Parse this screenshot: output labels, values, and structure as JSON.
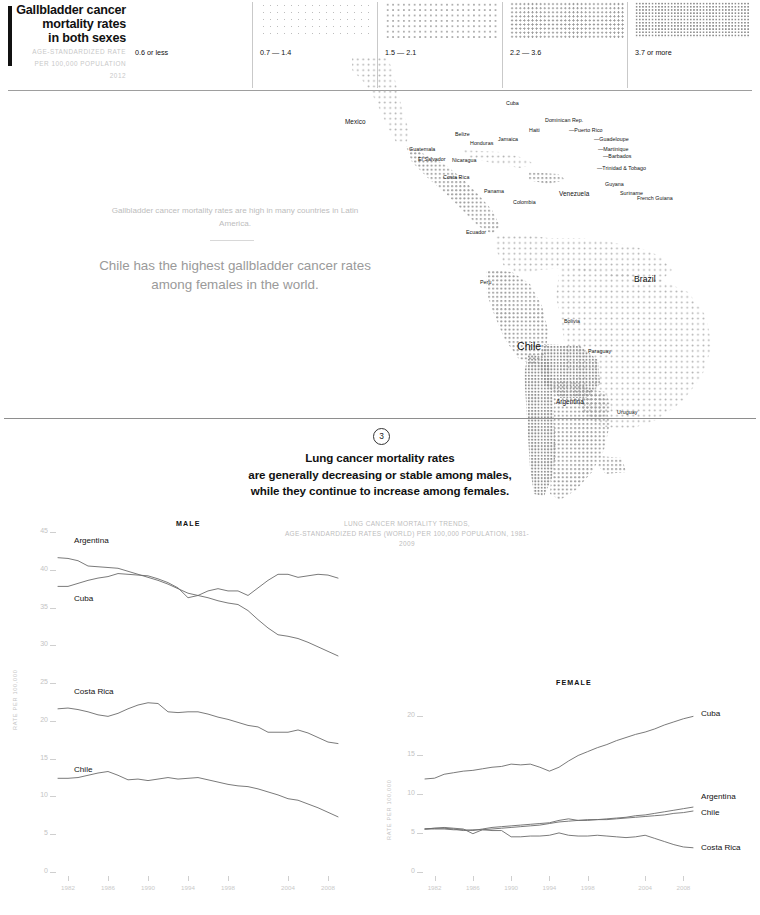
{
  "header": {
    "title_lines": [
      "Gallbladder cancer",
      "mortality rates",
      "in both sexes"
    ],
    "subtitle_lines": [
      "AGE-STANDARDIZED RATE",
      "PER 100,000 POPULATION",
      "2012"
    ]
  },
  "legend": {
    "items": [
      {
        "label": "0.6 or less",
        "density": "d1"
      },
      {
        "label": "0.7 — 1.4",
        "density": "d2"
      },
      {
        "label": "1.5 — 2.1",
        "density": "d3"
      },
      {
        "label": "2.2 — 3.6",
        "density": "d4"
      },
      {
        "label": "3.7 or more",
        "density": "d5"
      }
    ]
  },
  "map": {
    "labels": [
      {
        "name": "Mexico",
        "x": 345,
        "y": 118,
        "size": "md"
      },
      {
        "name": "Guatemala",
        "x": 409,
        "y": 146,
        "size": "sm"
      },
      {
        "name": "Belize",
        "x": 455,
        "y": 131,
        "size": "sm"
      },
      {
        "name": "Honduras",
        "x": 470,
        "y": 140,
        "size": "sm"
      },
      {
        "name": "El Salvador",
        "x": 418,
        "y": 156,
        "size": "sm"
      },
      {
        "name": "Nicaragua",
        "x": 452,
        "y": 157,
        "size": "sm"
      },
      {
        "name": "Costa Rica",
        "x": 443,
        "y": 174,
        "size": "sm"
      },
      {
        "name": "Panama",
        "x": 484,
        "y": 188,
        "size": "sm"
      },
      {
        "name": "Cuba",
        "x": 506,
        "y": 100,
        "size": "sm"
      },
      {
        "name": "Jamaica",
        "x": 498,
        "y": 136,
        "size": "sm"
      },
      {
        "name": "Haiti",
        "x": 529,
        "y": 127,
        "size": "sm"
      },
      {
        "name": "Dominican Rep.",
        "x": 545,
        "y": 117,
        "size": "sm"
      },
      {
        "name": "—Puerto Rico",
        "x": 569,
        "y": 127,
        "size": "sm"
      },
      {
        "name": "—Guadeloupe",
        "x": 594,
        "y": 136,
        "size": "sm"
      },
      {
        "name": "—Martinique",
        "x": 598,
        "y": 146,
        "size": "sm"
      },
      {
        "name": "—Barbados",
        "x": 603,
        "y": 153,
        "size": "sm"
      },
      {
        "name": "—Trinidad & Tobago",
        "x": 597,
        "y": 165,
        "size": "sm"
      },
      {
        "name": "Colombia",
        "x": 513,
        "y": 199,
        "size": "sm"
      },
      {
        "name": "Venezuela",
        "x": 559,
        "y": 190,
        "size": "md"
      },
      {
        "name": "Guyana",
        "x": 605,
        "y": 181,
        "size": "sm"
      },
      {
        "name": "Suriname",
        "x": 620,
        "y": 190,
        "size": "sm"
      },
      {
        "name": "French Guiana",
        "x": 637,
        "y": 195,
        "size": "sm"
      },
      {
        "name": "Ecuador",
        "x": 466,
        "y": 229,
        "size": "sm"
      },
      {
        "name": "Peru",
        "x": 480,
        "y": 279,
        "size": "sm"
      },
      {
        "name": "Brazil",
        "x": 634,
        "y": 274,
        "size": "lg"
      },
      {
        "name": "Bolivia",
        "x": 564,
        "y": 318,
        "size": "sm"
      },
      {
        "name": "Chile",
        "x": 517,
        "y": 340,
        "size": "xl"
      },
      {
        "name": "Paraguay",
        "x": 588,
        "y": 348,
        "size": "sm"
      },
      {
        "name": "Argentina",
        "x": 556,
        "y": 398,
        "size": "md"
      },
      {
        "name": "Uruguay",
        "x": 617,
        "y": 409,
        "size": "sm"
      }
    ]
  },
  "annotations": {
    "small": "Gallbladder cancer mortality rates are high in many countries in Latin America.",
    "large": "Chile has the highest gallbladder cancer rates among females in the world."
  },
  "section3": {
    "number": "3",
    "heading_lines": [
      "Lung cancer mortality rates",
      "are generally decreasing or stable among males,",
      "while they continue to increase among females."
    ],
    "chart_subtitle_lines": [
      "LUNG CANCER MORTALITY TRENDS,",
      "AGE-STANDARDIZED RATES (WORLD) PER 100,000 POPULATION, 1981-2009"
    ]
  },
  "chart_data": [
    {
      "type": "line",
      "panel": "MALE",
      "title": "LUNG CANCER MORTALITY TRENDS,",
      "subtitle": "AGE-STANDARDIZED RATES (WORLD) PER 100,000 POPULATION, 1981-2009",
      "xlabel": "",
      "ylabel": "RATE PER 100,000",
      "xlim": [
        1981,
        2009
      ],
      "ylim": [
        0,
        45
      ],
      "yticks": [
        0,
        5,
        10,
        15,
        20,
        25,
        30,
        35,
        40,
        45
      ],
      "xticks": [
        1982,
        1986,
        1990,
        1994,
        1998,
        2004,
        2008
      ],
      "grid": false,
      "legend_position": "inline-left",
      "x": [
        1981,
        1982,
        1983,
        1984,
        1985,
        1986,
        1987,
        1988,
        1989,
        1990,
        1991,
        1992,
        1993,
        1994,
        1995,
        1996,
        1997,
        1998,
        1999,
        2000,
        2001,
        2002,
        2003,
        2004,
        2005,
        2006,
        2007,
        2008,
        2009
      ],
      "series": [
        {
          "name": "Argentina",
          "label_side": "left",
          "values": [
            41.6,
            41.5,
            41.2,
            40.5,
            40.4,
            40.3,
            40.2,
            39.8,
            39.4,
            39.0,
            38.6,
            38.1,
            37.5,
            36.9,
            36.6,
            36.3,
            35.9,
            35.6,
            35.4,
            34.6,
            33.4,
            32.3,
            31.4,
            31.2,
            30.9,
            30.4,
            29.8,
            29.2,
            28.6
          ]
        },
        {
          "name": "Cuba",
          "label_side": "left",
          "values": [
            37.8,
            37.8,
            38.2,
            38.6,
            38.9,
            39.1,
            39.5,
            39.4,
            39.3,
            39.2,
            38.8,
            38.3,
            37.6,
            36.3,
            36.6,
            37.2,
            37.5,
            37.2,
            37.2,
            36.6,
            37.6,
            38.6,
            39.4,
            39.4,
            39.0,
            39.2,
            39.4,
            39.3,
            38.9
          ]
        },
        {
          "name": "Costa Rica",
          "label_side": "left",
          "values": [
            21.6,
            21.7,
            21.5,
            21.2,
            20.8,
            20.6,
            21.0,
            21.6,
            22.1,
            22.4,
            22.3,
            21.2,
            21.1,
            21.2,
            21.2,
            20.9,
            20.5,
            20.2,
            19.8,
            19.4,
            19.2,
            18.5,
            18.5,
            18.5,
            18.8,
            18.4,
            17.8,
            17.2,
            17.0
          ]
        },
        {
          "name": "Chile",
          "label_side": "left",
          "values": [
            12.4,
            12.4,
            12.5,
            12.8,
            13.1,
            13.3,
            12.8,
            12.2,
            12.3,
            12.1,
            12.3,
            12.5,
            12.3,
            12.4,
            12.5,
            12.2,
            11.9,
            11.6,
            11.4,
            11.3,
            11.0,
            10.6,
            10.2,
            9.7,
            9.5,
            9.0,
            8.5,
            7.9,
            7.3
          ]
        }
      ]
    },
    {
      "type": "line",
      "panel": "FEMALE",
      "xlabel": "",
      "ylabel": "RATE PER 100,000",
      "xlim": [
        1981,
        2009
      ],
      "ylim": [
        0,
        22
      ],
      "yticks": [
        0,
        5,
        10,
        15,
        20
      ],
      "xticks": [
        1982,
        1986,
        1990,
        1994,
        1998,
        2004,
        2008
      ],
      "grid": false,
      "legend_position": "right",
      "x": [
        1981,
        1982,
        1983,
        1984,
        1985,
        1986,
        1987,
        1988,
        1989,
        1990,
        1991,
        1992,
        1993,
        1994,
        1995,
        1996,
        1997,
        1998,
        1999,
        2000,
        2001,
        2002,
        2003,
        2004,
        2005,
        2006,
        2007,
        2008,
        2009
      ],
      "series": [
        {
          "name": "Cuba",
          "label_side": "right",
          "values": [
            11.9,
            12.0,
            12.5,
            12.7,
            12.9,
            13.0,
            13.2,
            13.4,
            13.5,
            13.8,
            13.7,
            13.8,
            13.4,
            12.9,
            13.4,
            14.2,
            14.9,
            15.4,
            15.9,
            16.3,
            16.8,
            17.2,
            17.6,
            17.9,
            18.3,
            18.8,
            19.2,
            19.6,
            19.9
          ]
        },
        {
          "name": "Argentina",
          "label_side": "right",
          "values": [
            5.5,
            5.5,
            5.5,
            5.4,
            5.4,
            5.3,
            5.5,
            5.7,
            5.8,
            5.9,
            6.0,
            6.1,
            6.2,
            6.3,
            6.6,
            6.8,
            6.6,
            6.6,
            6.7,
            6.8,
            6.9,
            7.0,
            7.2,
            7.3,
            7.5,
            7.7,
            7.9,
            8.1,
            8.3
          ]
        },
        {
          "name": "Chile",
          "label_side": "right",
          "values": [
            5.5,
            5.6,
            5.7,
            5.6,
            5.5,
            4.9,
            5.4,
            5.5,
            5.6,
            5.7,
            5.8,
            5.9,
            6.0,
            6.2,
            6.4,
            6.5,
            6.6,
            6.7,
            6.7,
            6.7,
            6.8,
            6.9,
            7.0,
            7.1,
            7.2,
            7.3,
            7.5,
            7.6,
            7.8
          ]
        },
        {
          "name": "Costa Rica",
          "label_side": "right",
          "values": [
            5.5,
            5.6,
            5.6,
            5.5,
            5.3,
            5.4,
            5.4,
            5.3,
            5.3,
            4.5,
            4.5,
            4.6,
            4.6,
            4.7,
            5.0,
            4.7,
            4.6,
            4.6,
            4.7,
            4.6,
            4.5,
            4.4,
            4.5,
            4.7,
            4.3,
            3.9,
            3.5,
            3.2,
            3.1
          ]
        }
      ]
    }
  ]
}
